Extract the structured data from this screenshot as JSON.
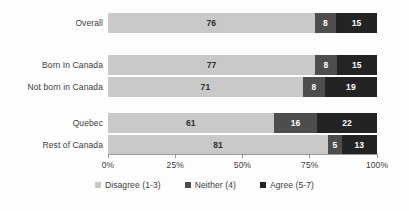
{
  "chart_data": {
    "type": "bar",
    "orientation": "horizontal",
    "stacked": true,
    "stack_mode": "percent",
    "title": "",
    "subtitle": "",
    "xlabel": "",
    "ylabel": "",
    "xlim": [
      0,
      100
    ],
    "xticks": [
      "0%",
      "25%",
      "50%",
      "75%",
      "100%"
    ],
    "xtick_values": [
      0,
      25,
      50,
      75,
      100
    ],
    "grid": false,
    "legend_position": "bottom",
    "categories": [
      "Overall",
      "Born In Canada",
      "Not born in Canada",
      "Quebec",
      "Rest of Canada"
    ],
    "series": [
      {
        "name": "Disagree (1-3)",
        "color": "#c9c9c9",
        "values": [
          76,
          77,
          71,
          61,
          81
        ]
      },
      {
        "name": "Neither (4)",
        "color": "#4d4d4d",
        "values": [
          8,
          8,
          8,
          16,
          5
        ]
      },
      {
        "name": "Agree (5-7)",
        "color": "#232323",
        "values": [
          15,
          15,
          19,
          22,
          13
        ]
      }
    ],
    "rows": [
      {
        "label": "Overall",
        "group": 0,
        "segments": [
          {
            "series": "Disagree (1-3)",
            "value": 76,
            "label": "76"
          },
          {
            "series": "Neither (4)",
            "value": 8,
            "label": "8"
          },
          {
            "series": "Agree (5-7)",
            "value": 15,
            "label": "15"
          }
        ]
      },
      {
        "label": "Born In Canada",
        "group": 1,
        "segments": [
          {
            "series": "Disagree (1-3)",
            "value": 77,
            "label": "77"
          },
          {
            "series": "Neither (4)",
            "value": 8,
            "label": "8"
          },
          {
            "series": "Agree (5-7)",
            "value": 15,
            "label": "15"
          }
        ]
      },
      {
        "label": "Not born in Canada",
        "group": 1,
        "segments": [
          {
            "series": "Disagree (1-3)",
            "value": 71,
            "label": "71"
          },
          {
            "series": "Neither (4)",
            "value": 8,
            "label": "8"
          },
          {
            "series": "Agree (5-7)",
            "value": 19,
            "label": "19"
          }
        ]
      },
      {
        "label": "Quebec",
        "group": 2,
        "segments": [
          {
            "series": "Disagree (1-3)",
            "value": 61,
            "label": "61"
          },
          {
            "series": "Neither (4)",
            "value": 16,
            "label": "16"
          },
          {
            "series": "Agree (5-7)",
            "value": 22,
            "label": "22"
          }
        ]
      },
      {
        "label": "Rest of Canada",
        "group": 2,
        "segments": [
          {
            "series": "Disagree (1-3)",
            "value": 81,
            "label": "81"
          },
          {
            "series": "Neither (4)",
            "value": 5,
            "label": "5"
          },
          {
            "series": "Agree (5-7)",
            "value": 13,
            "label": "13"
          }
        ]
      }
    ],
    "legend": [
      {
        "label": "Disagree (1-3)",
        "color": "#c9c9c9"
      },
      {
        "label": "Neither (4)",
        "color": "#4d4d4d"
      },
      {
        "label": "Agree (5-7)",
        "color": "#232323"
      }
    ]
  },
  "colors": {
    "background": "#fdfdfd",
    "disagree": "#c9c9c9",
    "neither": "#4d4d4d",
    "agree": "#232323",
    "axis": "#9a9a9a",
    "text": "#3c3c3c"
  }
}
